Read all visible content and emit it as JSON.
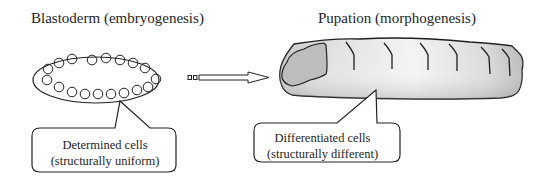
{
  "left_panel": {
    "title": "Blastoderm (embryogenesis)",
    "callout": {
      "line1": "Determined cells",
      "line2": "(structurally uniform)"
    },
    "cell_count": 21
  },
  "right_panel": {
    "title": "Pupation (morphogenesis)",
    "callout": {
      "line1": "Differentiated cells",
      "line2": "(structurally different)"
    },
    "segment_lines": 6
  },
  "arrow": {
    "direction": "right",
    "style": "hollow-dashed-tail"
  },
  "colors": {
    "stroke": "#222222",
    "pupa_fill_light": "#f2f2f2",
    "pupa_fill_dark": "#b8b8b8",
    "background": "#ffffff"
  }
}
